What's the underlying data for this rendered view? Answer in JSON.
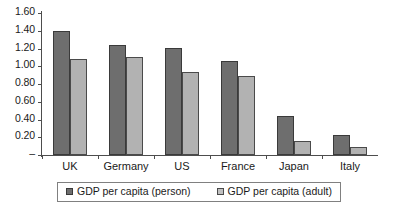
{
  "chart_data": {
    "type": "bar",
    "title": "",
    "subtitle": "",
    "xlabel": "",
    "ylabel": "",
    "categories": [
      "UK",
      "Germany",
      "US",
      "France",
      "Japan",
      "Italy"
    ],
    "series": [
      {
        "name": "GDP per capita (person)",
        "color": "#6e6e6e",
        "values": [
          1.4,
          1.24,
          1.21,
          1.06,
          0.44,
          0.22
        ]
      },
      {
        "name": "GDP per capita (adult)",
        "color": "#b2b2b2",
        "values": [
          1.08,
          1.1,
          0.94,
          0.89,
          0.16,
          0.09
        ]
      }
    ],
    "ylim": [
      0,
      1.6
    ],
    "ytick_values": [
      1.6,
      1.4,
      1.2,
      1.0,
      0.8,
      0.6,
      0.4,
      0.2,
      0.0
    ],
    "ytick_labels": [
      "1.60",
      "1.40",
      "1.20",
      "1.00",
      "0.80",
      "0.60",
      "0.40",
      "0.20",
      "–"
    ],
    "grid": false,
    "legend_position": "bottom",
    "legend": [
      "GDP per capita (person)",
      "GDP per capita (adult)"
    ]
  }
}
